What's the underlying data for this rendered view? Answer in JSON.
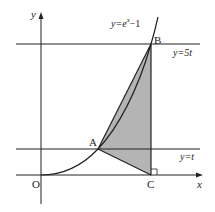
{
  "diagram": {
    "axes": {
      "x_label": "x",
      "y_label": "y",
      "origin_label": "O"
    },
    "curve": {
      "label_prefix": "y=e",
      "label_exp": "x",
      "label_suffix": "−1"
    },
    "lines": [
      {
        "label": "y=5t"
      },
      {
        "label": "y=t"
      }
    ],
    "points": {
      "A": "A",
      "B": "B",
      "C": "C"
    },
    "colors": {
      "stroke": "#222222",
      "shade": "#b4b4b4",
      "background": "#ffffff"
    }
  }
}
